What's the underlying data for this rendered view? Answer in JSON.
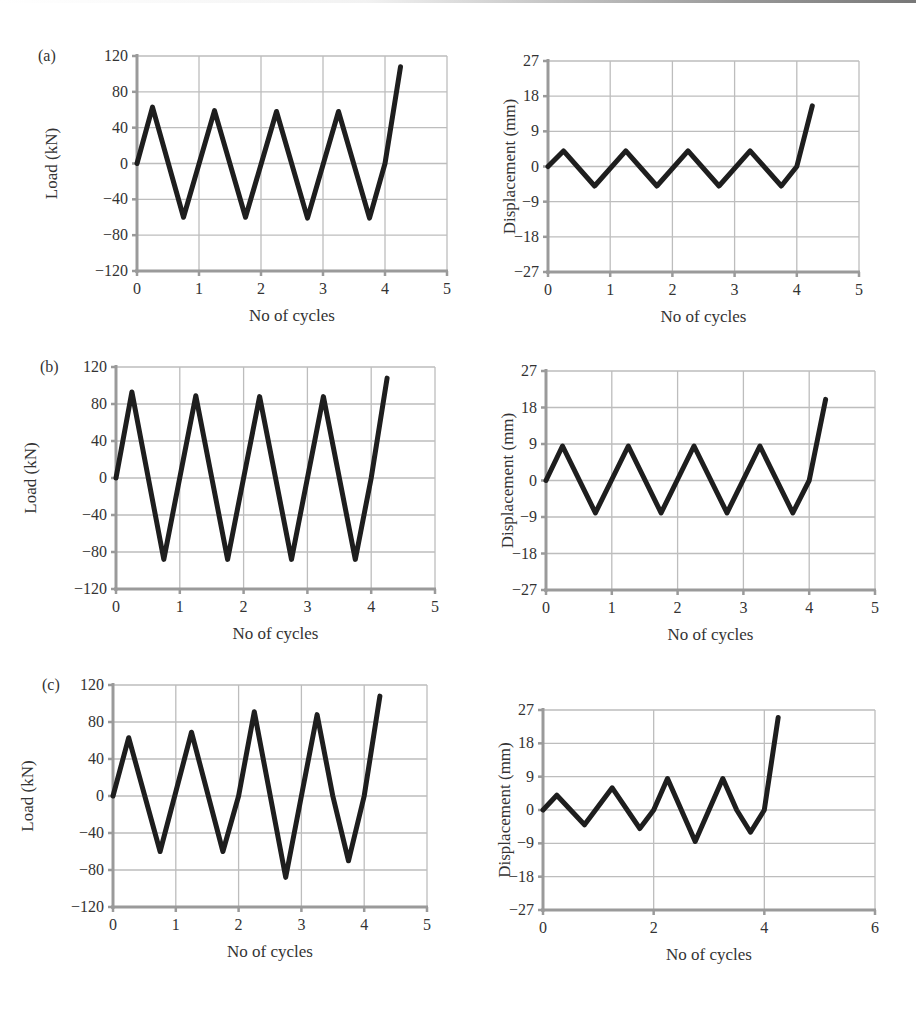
{
  "figure": {
    "panels": [
      {
        "label": "(a)"
      },
      {
        "label": "(b)"
      },
      {
        "label": "(c)"
      }
    ]
  },
  "chart_data": [
    {
      "id": "a-load",
      "panel": "(a)",
      "type": "line",
      "title": "",
      "xlabel": "No of cycles",
      "ylabel": "Load (kN)",
      "xlim": [
        0,
        5
      ],
      "ylim": [
        -120,
        120
      ],
      "xticks": [
        0,
        1,
        2,
        3,
        4,
        5
      ],
      "yticks": [
        -120,
        -80,
        -40,
        0,
        40,
        80,
        120
      ],
      "grid": true,
      "legend": null,
      "series": [
        {
          "name": "Load",
          "x": [
            0,
            0.25,
            0.75,
            1.25,
            1.75,
            2.25,
            2.75,
            3.25,
            3.75,
            4.0,
            4.25
          ],
          "y": [
            0,
            63,
            -60,
            59,
            -60,
            58,
            -61,
            58,
            -61,
            0,
            108
          ]
        }
      ]
    },
    {
      "id": "a-disp",
      "panel": "(a)",
      "type": "line",
      "title": "",
      "xlabel": "No of cycles",
      "ylabel": "Displacement (mm)",
      "xlim": [
        0,
        5
      ],
      "ylim": [
        -27,
        27
      ],
      "xticks": [
        0,
        1,
        2,
        3,
        4,
        5
      ],
      "yticks": [
        -27,
        -18,
        -9,
        0,
        9,
        18,
        27
      ],
      "grid": true,
      "legend": null,
      "series": [
        {
          "name": "Displacement",
          "x": [
            0,
            0.25,
            0.75,
            1.25,
            1.75,
            2.25,
            2.75,
            3.25,
            3.75,
            4.0,
            4.25
          ],
          "y": [
            0,
            4,
            -5,
            4,
            -5,
            4,
            -5,
            4,
            -5,
            0,
            15.5
          ]
        }
      ]
    },
    {
      "id": "b-load",
      "panel": "(b)",
      "type": "line",
      "title": "",
      "xlabel": "No of cycles",
      "ylabel": "Load (kN)",
      "xlim": [
        0,
        5
      ],
      "ylim": [
        -120,
        120
      ],
      "xticks": [
        0,
        1,
        2,
        3,
        4,
        5
      ],
      "yticks": [
        -120,
        -80,
        -40,
        0,
        40,
        80,
        120
      ],
      "grid": true,
      "legend": null,
      "series": [
        {
          "name": "Load",
          "x": [
            0,
            0.25,
            0.75,
            1.25,
            1.75,
            2.25,
            2.75,
            3.25,
            3.75,
            4.0,
            4.25
          ],
          "y": [
            0,
            93,
            -88,
            89,
            -88,
            88,
            -88,
            88,
            -88,
            0,
            108
          ]
        }
      ]
    },
    {
      "id": "b-disp",
      "panel": "(b)",
      "type": "line",
      "title": "",
      "xlabel": "No of cycles",
      "ylabel": "Displacement (mm)",
      "xlim": [
        0,
        5
      ],
      "ylim": [
        -27,
        27
      ],
      "xticks": [
        0,
        1,
        2,
        3,
        4,
        5
      ],
      "yticks": [
        -27,
        -18,
        -9,
        0,
        9,
        18,
        27
      ],
      "grid": true,
      "legend": null,
      "series": [
        {
          "name": "Displacement",
          "x": [
            0,
            0.25,
            0.75,
            1.25,
            1.75,
            2.25,
            2.75,
            3.25,
            3.75,
            4.0,
            4.25
          ],
          "y": [
            0,
            8.5,
            -8,
            8.5,
            -8,
            8.5,
            -8,
            8.5,
            -8,
            0,
            20
          ]
        }
      ]
    },
    {
      "id": "c-load",
      "panel": "(c)",
      "type": "line",
      "title": "",
      "xlabel": "No of cycles",
      "ylabel": "Load (kN)",
      "xlim": [
        0,
        5
      ],
      "ylim": [
        -120,
        120
      ],
      "xticks": [
        0,
        1,
        2,
        3,
        4,
        5
      ],
      "yticks": [
        -120,
        -80,
        -40,
        0,
        40,
        80,
        120
      ],
      "grid": true,
      "legend": null,
      "series": [
        {
          "name": "Load",
          "x": [
            0,
            0.25,
            0.75,
            1.25,
            1.75,
            2.0,
            2.25,
            2.75,
            3.25,
            3.5,
            3.75,
            4.0,
            4.25
          ],
          "y": [
            0,
            63,
            -60,
            69,
            -60,
            0,
            91,
            -88,
            88,
            0,
            -70,
            0,
            108
          ]
        }
      ]
    },
    {
      "id": "c-disp",
      "panel": "(c)",
      "type": "line",
      "title": "",
      "xlabel": "No of cycles",
      "ylabel": "Displacement (mm)",
      "xlim": [
        0,
        6
      ],
      "ylim": [
        -27,
        27
      ],
      "xticks": [
        0,
        2,
        4,
        6
      ],
      "yticks": [
        -27,
        -18,
        -9,
        0,
        9,
        18,
        27
      ],
      "grid": true,
      "legend": null,
      "series": [
        {
          "name": "Displacement",
          "x": [
            0,
            0.25,
            0.75,
            1.25,
            1.75,
            2.0,
            2.25,
            2.75,
            3.25,
            3.5,
            3.75,
            4.0,
            4.25
          ],
          "y": [
            0,
            4,
            -4,
            6,
            -5,
            0,
            8.5,
            -8.5,
            8.5,
            0,
            -6,
            0,
            25
          ]
        }
      ]
    }
  ],
  "layout": {
    "plots": [
      {
        "id": "a-load",
        "left": 137,
        "top": 56,
        "right": 447,
        "bottom": 271,
        "label_x": 38
      },
      {
        "id": "a-disp",
        "left": 548,
        "top": 61,
        "right": 859,
        "bottom": 272
      },
      {
        "id": "b-load",
        "left": 116,
        "top": 367,
        "right": 435,
        "bottom": 589,
        "label_x": 40
      },
      {
        "id": "b-disp",
        "left": 546,
        "top": 371,
        "right": 875,
        "bottom": 590
      },
      {
        "id": "c-load",
        "left": 113,
        "top": 685,
        "right": 427,
        "bottom": 907,
        "label_x": 42
      },
      {
        "id": "c-disp",
        "left": 543,
        "top": 710,
        "right": 875,
        "bottom": 910
      }
    ],
    "colors": {
      "line": "#1e1e1e",
      "axis": "#9a9a9a",
      "grid": "#bdbdbd",
      "text": "#333333"
    }
  }
}
